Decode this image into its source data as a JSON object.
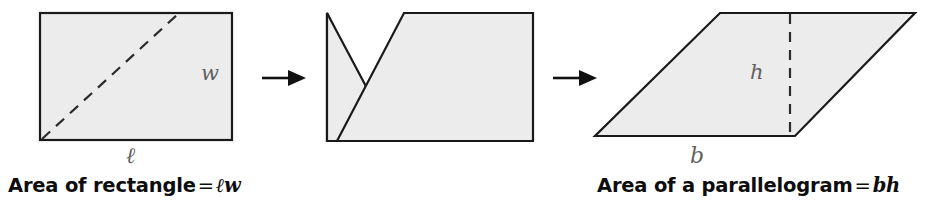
{
  "diagram": {
    "background_color": "#ffffff",
    "shape_fill": "#ececec",
    "stroke_color": "#1a1a1a",
    "label_color": "#5f5f5f",
    "caption_color": "#0d0d0d",
    "steps": [
      {
        "name": "rectangle",
        "shape": "rectangle",
        "dimension_labels": [
          "w",
          "ℓ"
        ],
        "has_dashed_diagonal": true
      },
      {
        "name": "cut-rectangle",
        "shape": "rectangle-cut-along-diagonal",
        "dimension_labels": [],
        "has_dashed_diagonal": false
      },
      {
        "name": "parallelogram",
        "shape": "parallelogram",
        "dimension_labels": [
          "h",
          "b"
        ],
        "has_dashed_height": true
      }
    ],
    "arrows": [
      {
        "name": "arrow-1",
        "direction": "right"
      },
      {
        "name": "arrow-2",
        "direction": "right"
      }
    ],
    "labels": {
      "width": "w",
      "length": "ℓ",
      "height": "h",
      "base": "b"
    },
    "captions": {
      "rectangle": {
        "text_lead": "Area of rectangle",
        "equals": "=",
        "formula": "ℓw",
        "full": "Area of rectangle = ℓw"
      },
      "parallelogram": {
        "text_lead": "Area of a parallelogram",
        "equals": "=",
        "formula": "bh",
        "full": "Area of a parallelogram = bh"
      }
    }
  }
}
